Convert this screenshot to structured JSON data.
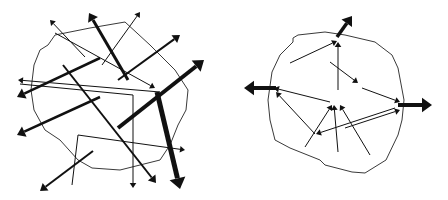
{
  "diagrams": [
    {
      "name": "left-diagram",
      "blob": [
        [
          55,
          35
        ],
        [
          90,
          28
        ],
        [
          125,
          22
        ],
        [
          150,
          45
        ],
        [
          175,
          70
        ],
        [
          188,
          90
        ],
        [
          186,
          110
        ],
        [
          178,
          125
        ],
        [
          170,
          145
        ],
        [
          160,
          160
        ],
        [
          120,
          170
        ],
        [
          92,
          168
        ],
        [
          78,
          160
        ],
        [
          60,
          140
        ],
        [
          45,
          130
        ],
        [
          34,
          110
        ],
        [
          31,
          90
        ],
        [
          34,
          65
        ],
        [
          40,
          50
        ],
        [
          48,
          45
        ],
        [
          55,
          35
        ]
      ],
      "arrows": [
        {
          "points": [
            [
              85,
              57
            ],
            [
              50,
              20
            ]
          ],
          "width": 1,
          "head": 5
        },
        {
          "points": [
            [
              128,
              80
            ],
            [
              89,
              13
            ]
          ],
          "width": 3,
          "head": 8
        },
        {
          "points": [
            [
              102,
              65
            ],
            [
              140,
              12
            ]
          ],
          "width": 1,
          "head": 5
        },
        {
          "points": [
            [
              118,
              80
            ],
            [
              180,
              35
            ]
          ],
          "width": 2,
          "head": 7
        },
        {
          "points": [
            [
              118,
              128
            ],
            [
              204,
              60
            ]
          ],
          "width": 4,
          "head": 10
        },
        {
          "points": [
            [
              100,
              58
            ],
            [
              17,
              97
            ]
          ],
          "width": 2.5,
          "head": 8
        },
        {
          "points": [
            [
              100,
              97
            ],
            [
              17,
              135
            ]
          ],
          "width": 2.5,
          "head": 8
        },
        {
          "points": [
            [
              63,
              65
            ],
            [
              156,
              183
            ]
          ],
          "width": 2,
          "head": 7
        },
        {
          "points": [
            [
              157,
              92
            ],
            [
              180,
              189
            ]
          ],
          "width": 5,
          "head": 11
        },
        {
          "points": [
            [
              55,
              33
            ],
            [
              155,
              88
            ]
          ],
          "width": 1,
          "head": 5
        },
        {
          "points": [
            [
              160,
              92
            ],
            [
              18,
              80
            ]
          ],
          "width": 1,
          "head": 5
        },
        {
          "points": [
            [
              20,
              84
            ],
            [
              133,
              95
            ],
            [
              133,
              188
            ]
          ],
          "width": 1,
          "head": 5
        },
        {
          "points": [
            [
              72,
              185
            ],
            [
              78,
              135
            ],
            [
              185,
              150
            ]
          ],
          "width": 1,
          "head": 5
        },
        {
          "points": [
            [
              93,
              151
            ],
            [
              40,
              191
            ]
          ],
          "width": 2,
          "head": 7
        }
      ]
    },
    {
      "name": "right-diagram",
      "blob": [
        [
          293,
          38
        ],
        [
          298,
          35
        ],
        [
          325,
          32
        ],
        [
          345,
          35
        ],
        [
          375,
          42
        ],
        [
          392,
          55
        ],
        [
          398,
          68
        ],
        [
          404,
          100
        ],
        [
          402,
          120
        ],
        [
          398,
          135
        ],
        [
          386,
          160
        ],
        [
          365,
          173
        ],
        [
          352,
          172
        ],
        [
          325,
          165
        ],
        [
          320,
          160
        ],
        [
          300,
          152
        ],
        [
          290,
          148
        ],
        [
          275,
          140
        ],
        [
          270,
          120
        ],
        [
          268,
          100
        ],
        [
          272,
          72
        ],
        [
          280,
          55
        ],
        [
          293,
          42
        ],
        [
          293,
          38
        ]
      ],
      "arrows": [
        {
          "points": [
            [
              337,
              37
            ],
            [
              352,
              16
            ]
          ],
          "width": 3.5,
          "head": 9
        },
        {
          "points": [
            [
              276,
              88
            ],
            [
              244,
              88
            ]
          ],
          "width": 4,
          "head": 10
        },
        {
          "points": [
            [
              398,
              105
            ],
            [
              432,
              105
            ]
          ],
          "width": 4,
          "head": 10
        },
        {
          "points": [
            [
              290,
              63
            ],
            [
              337,
              41
            ]
          ],
          "width": 1,
          "head": 5
        },
        {
          "points": [
            [
              338,
              90
            ],
            [
              338,
              42
            ]
          ],
          "width": 1,
          "head": 5
        },
        {
          "points": [
            [
              330,
              62
            ],
            [
              358,
              83
            ]
          ],
          "width": 1,
          "head": 5
        },
        {
          "points": [
            [
              362,
              88
            ],
            [
              400,
              102
            ]
          ],
          "width": 1,
          "head": 5
        },
        {
          "points": [
            [
              330,
              102
            ],
            [
              274,
              88
            ]
          ],
          "width": 1,
          "head": 5
        },
        {
          "points": [
            [
              315,
              134
            ],
            [
              276,
              92
            ]
          ],
          "width": 1,
          "head": 5
        },
        {
          "points": [
            [
              305,
              147
            ],
            [
              332,
              105
            ]
          ],
          "width": 1,
          "head": 5
        },
        {
          "points": [
            [
              338,
              152
            ],
            [
              334,
              105
            ]
          ],
          "width": 1,
          "head": 5
        },
        {
          "points": [
            [
              370,
              155
            ],
            [
              340,
              105
            ]
          ],
          "width": 1,
          "head": 5
        },
        {
          "points": [
            [
              395,
              108
            ],
            [
              316,
              134
            ]
          ],
          "width": 1,
          "head": 5
        },
        {
          "points": [
            [
              345,
              128
            ],
            [
              400,
              110
            ]
          ],
          "width": 1,
          "head": 5
        }
      ]
    }
  ]
}
